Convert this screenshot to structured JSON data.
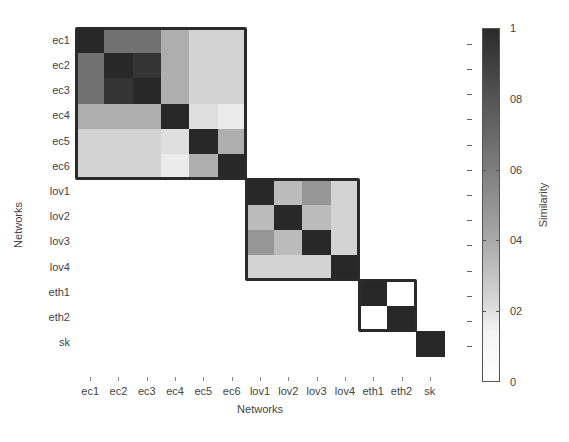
{
  "chart_data": {
    "type": "heatmap",
    "title": "",
    "xlabel": "Networks",
    "ylabel": "Networks",
    "labels": [
      "ec1",
      "ec2",
      "ec3",
      "ec4",
      "ec5",
      "ec6",
      "lov1",
      "lov2",
      "lov3",
      "lov4",
      "eth1",
      "eth2",
      "sk"
    ],
    "matrix": [
      [
        1.0,
        0.7,
        0.7,
        0.45,
        0.3,
        0.3,
        0,
        0,
        0,
        0,
        0,
        0,
        0
      ],
      [
        0.7,
        1.0,
        0.95,
        0.45,
        0.3,
        0.3,
        0,
        0,
        0,
        0,
        0,
        0,
        0
      ],
      [
        0.7,
        0.95,
        1.0,
        0.45,
        0.3,
        0.3,
        0,
        0,
        0,
        0,
        0,
        0,
        0
      ],
      [
        0.45,
        0.45,
        0.45,
        1.0,
        0.25,
        0.2,
        0,
        0,
        0,
        0,
        0,
        0,
        0
      ],
      [
        0.3,
        0.3,
        0.3,
        0.25,
        1.0,
        0.45,
        0,
        0,
        0,
        0,
        0,
        0,
        0
      ],
      [
        0.3,
        0.3,
        0.3,
        0.2,
        0.45,
        1.0,
        0,
        0,
        0,
        0,
        0,
        0,
        0
      ],
      [
        0,
        0,
        0,
        0,
        0,
        0,
        1.0,
        0.4,
        0.55,
        0.3,
        0,
        0,
        0
      ],
      [
        0,
        0,
        0,
        0,
        0,
        0,
        0.4,
        1.0,
        0.4,
        0.3,
        0,
        0,
        0
      ],
      [
        0,
        0,
        0,
        0,
        0,
        0,
        0.55,
        0.4,
        1.0,
        0.3,
        0,
        0,
        0
      ],
      [
        0,
        0,
        0,
        0,
        0,
        0,
        0.3,
        0.3,
        0.3,
        1.0,
        0,
        0,
        0
      ],
      [
        0,
        0,
        0,
        0,
        0,
        0,
        0,
        0,
        0,
        0,
        1.0,
        0,
        0
      ],
      [
        0,
        0,
        0,
        0,
        0,
        0,
        0,
        0,
        0,
        0,
        0,
        1.0,
        0
      ],
      [
        0,
        0,
        0,
        0,
        0,
        0,
        0,
        0,
        0,
        0,
        0,
        0,
        1.0
      ]
    ],
    "blocks": [
      {
        "name": "ec",
        "start": 0,
        "end": 5
      },
      {
        "name": "lov",
        "start": 6,
        "end": 9
      },
      {
        "name": "eth",
        "start": 10,
        "end": 11
      }
    ],
    "colorbar": {
      "label": "Similarity",
      "range": [
        0,
        1
      ],
      "ticks": [
        0,
        0.2,
        0.4,
        0.6,
        0.8,
        1
      ],
      "tick_labels": [
        "0",
        "02",
        "04",
        "06",
        "08",
        "1"
      ],
      "colormap": "gray_reversed"
    },
    "grid": false
  },
  "axes": {
    "x_title": "Networks",
    "y_title": "Networks",
    "colorbar_title": "Similarity"
  }
}
